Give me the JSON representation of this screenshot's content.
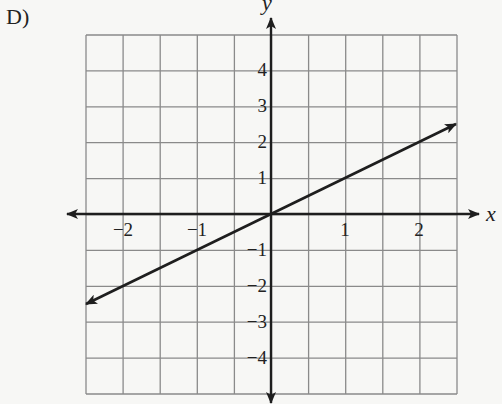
{
  "choice_label": "D)",
  "colors": {
    "background": "#f7f7f5",
    "grid": "#8a8a8a",
    "axis": "#1e1e1e",
    "line": "#1e1e1e",
    "text": "#222222"
  },
  "chart_data": {
    "type": "line",
    "title": "",
    "xlabel": "x",
    "ylabel": "y",
    "xlim": [
      -2.5,
      2.5
    ],
    "ylim": [
      -5,
      5
    ],
    "x_ticks": [
      -2,
      -1,
      1,
      2
    ],
    "x_tick_labels": [
      "−2",
      "−1",
      "1",
      "2"
    ],
    "y_ticks": [
      -4,
      -3,
      -2,
      -1,
      1,
      2,
      3,
      4
    ],
    "y_tick_labels": [
      "−4",
      "−3",
      "−2",
      "−1",
      "1",
      "2",
      "3",
      "4"
    ],
    "grid": true,
    "grid_step_x": 0.5,
    "grid_step_y": 1,
    "legend": null,
    "series": [
      {
        "name": "y = x",
        "x": [
          -2.5,
          2.5
        ],
        "y": [
          -2.5,
          2.5
        ],
        "arrows_both_ends": true
      }
    ]
  },
  "layout": {
    "origin_px": [
      271,
      214
    ],
    "x_unit_px": 74,
    "y_unit_px": 36,
    "grid_left": 86,
    "grid_right": 457,
    "grid_top": 35,
    "grid_bottom": 394,
    "x_axis_extent": [
      67,
      479
    ],
    "y_axis_extent": [
      18,
      403
    ]
  }
}
